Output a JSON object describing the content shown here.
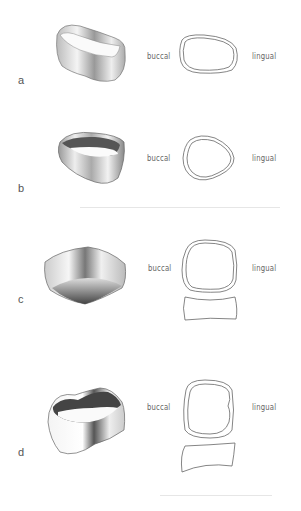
{
  "figure": {
    "panels": [
      {
        "id": "a",
        "letter": "a",
        "left_label": "buccal",
        "right_label": "lingual",
        "outline_shape": "oval",
        "has_side_profile": false
      },
      {
        "id": "b",
        "letter": "b",
        "left_label": "buccal",
        "right_label": "lingual",
        "outline_shape": "rounded-triangle",
        "has_side_profile": false
      },
      {
        "id": "c",
        "letter": "c",
        "left_label": "buccal",
        "right_label": "lingual",
        "outline_shape": "rounded-square",
        "has_side_profile": true
      },
      {
        "id": "d",
        "letter": "d",
        "left_label": "buccal",
        "right_label": "lingual",
        "outline_shape": "rounded-square",
        "has_side_profile": true
      }
    ]
  },
  "colors": {
    "background": "#ffffff",
    "line": "#666666",
    "text": "#555555"
  }
}
